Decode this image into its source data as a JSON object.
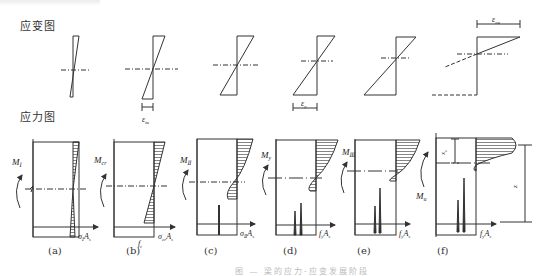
{
  "headings": {
    "strain": "应变图",
    "stress": "应力图"
  },
  "strain_labels": {
    "b": "ε_tu",
    "d": "ε_y",
    "f": "ε_cu"
  },
  "moment_labels": [
    "M_I",
    "M_cr",
    "M_II",
    "M_y",
    "M_III",
    "M_u"
  ],
  "force_labels": [
    "σ_I A_s",
    "σ_cr A_s",
    "σ_II A_s",
    "f_y A_s",
    "f_y A_s",
    "f_y A_s"
  ],
  "extra_labels": {
    "b_ft": "f_t",
    "f_xc": "x_c",
    "f_z": "z"
  },
  "panel_labels": [
    "(a)",
    "(b)",
    "(c)",
    "(d)",
    "(e)",
    "(f)"
  ],
  "caption": "图 — 梁的应力-应变发展阶段"
}
